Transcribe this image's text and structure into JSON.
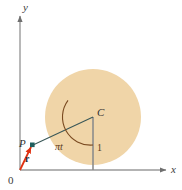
{
  "figure": {
    "background_color": "#ffffff",
    "width": 182,
    "height": 190
  },
  "colors": {
    "circle_fill": "#f0d5a8",
    "axis": "#9a9a9a",
    "radius_line": "#2f4f4f",
    "center_line": "#8c8c8c",
    "vector": "#e03010",
    "point_marker": "#1f5e5e",
    "arc": "#7a4a20",
    "label_dark": "#2e2e2e"
  },
  "axes": {
    "x_axis": {
      "label": "x",
      "origin_px": [
        20,
        170
      ],
      "end_px": [
        168,
        170
      ],
      "arrow": "right-arrow-icon"
    },
    "y_axis": {
      "label": "y",
      "origin_px": [
        20,
        170
      ],
      "end_px": [
        20,
        14
      ],
      "arrow": "up-arrow-icon"
    },
    "origin_label": "0"
  },
  "circle": {
    "center_px": [
      93,
      117
    ],
    "radius_px": 48,
    "center_label": "C",
    "tangent_point_px": [
      93,
      170
    ]
  },
  "points": {
    "P": {
      "label": "P",
      "position_px": [
        32,
        145
      ],
      "marker": "square-point-icon"
    },
    "C": {
      "label": "C",
      "position_px": [
        93,
        117
      ]
    }
  },
  "segments": {
    "center_to_ground": {
      "label": "1",
      "from_px": [
        93,
        117
      ],
      "to_px": [
        93,
        170
      ]
    },
    "center_to_P": {
      "from_px": [
        93,
        117
      ],
      "to_px": [
        32,
        145
      ]
    }
  },
  "angle": {
    "label": "πt",
    "vertex_px": [
      93,
      117
    ],
    "between": [
      "center-to-ground",
      "center-to-P"
    ]
  },
  "vector": {
    "label": "r",
    "from_px": [
      20,
      170
    ],
    "to_px": [
      32,
      145
    ],
    "arrow": "arrowhead-icon"
  }
}
